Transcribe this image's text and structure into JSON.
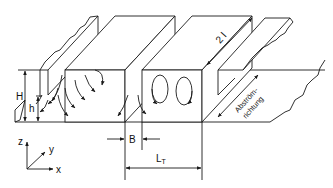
{
  "figure": {
    "type": "technical line drawing"
  },
  "labels": {
    "height_H": "H",
    "height_h": "h",
    "length_2l": "2 l",
    "width_B": "B",
    "spacing_LT": "L",
    "spacing_LT_sub": "T",
    "flow_direction_line1": "Abström-",
    "flow_direction_line2": "richtung"
  },
  "axes": {
    "z": "z",
    "y": "y",
    "x": "x"
  },
  "colors": {
    "line": "#1a1a1a",
    "background": "#ffffff"
  }
}
